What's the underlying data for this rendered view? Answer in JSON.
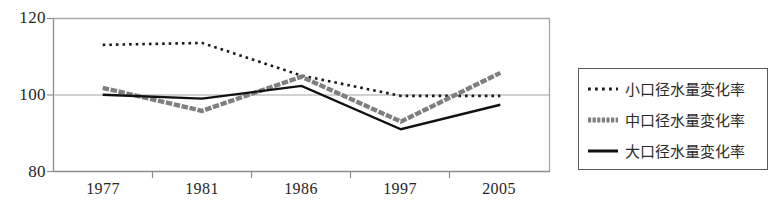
{
  "chart_data": {
    "type": "line",
    "title": "",
    "xlabel": "",
    "ylabel": "",
    "categories": [
      "1977",
      "1981",
      "1986",
      "1997",
      "2005"
    ],
    "ylim": [
      80,
      120
    ],
    "yticks": [
      80,
      100,
      120
    ],
    "grid": true,
    "legend_position": "right",
    "series": [
      {
        "name": "小口径水量変化率",
        "style": "dotted",
        "color": "#1a1a1a",
        "width": 2.6,
        "values": [
          113.0,
          113.5,
          105.0,
          99.7,
          99.7
        ]
      },
      {
        "name": "中口径水量変化率",
        "style": "thick-gray",
        "color": "#7f7f7f",
        "width": 4.4,
        "values": [
          101.8,
          95.8,
          104.7,
          93.0,
          105.7
        ]
      },
      {
        "name": "大口径水量変化率",
        "style": "solid",
        "color": "#111111",
        "width": 2.4,
        "values": [
          100.0,
          99.0,
          102.3,
          91.0,
          97.4
        ]
      }
    ]
  },
  "axis": {
    "y_labels": [
      "120",
      "100",
      "80"
    ],
    "x_labels": [
      "1977",
      "1981",
      "1986",
      "1997",
      "2005"
    ],
    "axis_color": "#8c8c8c",
    "gridline_color": "#a6a6a6"
  },
  "legend": {
    "border_color": "#5a5a5a",
    "items": [
      {
        "label": "小口径水量変化率",
        "marker": "dotted-line-marker"
      },
      {
        "label": "中口径水量変化率",
        "marker": "thick-gray-dashed-line-marker"
      },
      {
        "label": "大口径水量変化率",
        "marker": "solid-black-line-marker"
      }
    ]
  }
}
